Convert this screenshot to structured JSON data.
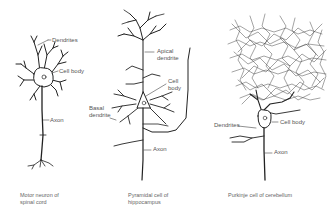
{
  "panels": [
    {
      "id": "motor-neuron",
      "caption_line1": "Motor neuron of",
      "caption_line2": "spinal cord",
      "labels": {
        "dendrites": "Dendrites",
        "cell_body": "Cell body",
        "axon": "Axon"
      }
    },
    {
      "id": "pyramidal-cell",
      "caption_line1": "Pyramidal cell of",
      "caption_line2": "hippocampus",
      "labels": {
        "apical_1": "Apical",
        "apical_2": "dendrite",
        "cell_body_1": "Cell",
        "cell_body_2": "body",
        "basal_1": "Basal",
        "basal_2": "dendrite",
        "axon": "Axon"
      }
    },
    {
      "id": "purkinje-cell",
      "caption_line1": "Purkinje cell of cerebellum",
      "labels": {
        "dendrites": "Dendrites",
        "cell_body": "Cell body",
        "axon": "Axon"
      }
    }
  ],
  "colors": {
    "ink": "#222222",
    "label": "#555555",
    "background": "#ffffff"
  }
}
